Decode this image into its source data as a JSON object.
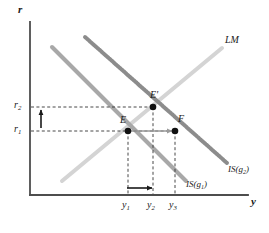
{
  "figure": {
    "kind": "is-lm-diagram",
    "background": "#ffffff"
  },
  "axes": {
    "y_axis_label": "r",
    "x_axis_label": "y",
    "axis_color": "#4d4d4d",
    "origin": [
      30,
      195
    ],
    "x_axis_end": [
      248,
      195
    ],
    "y_axis_end": [
      30,
      22
    ]
  },
  "ticks": {
    "y": [
      {
        "id": "r1",
        "base": "r",
        "sub": "1",
        "value_px": 131
      },
      {
        "id": "r2",
        "base": "r",
        "sub": "2",
        "value_px": 107
      }
    ],
    "x": [
      {
        "id": "y1",
        "base": "y",
        "sub": "1",
        "value_px": 128
      },
      {
        "id": "y2",
        "base": "y",
        "sub": "2",
        "value_px": 153
      },
      {
        "id": "y3",
        "base": "y",
        "sub": "3",
        "value_px": 175
      }
    ]
  },
  "curves": [
    {
      "id": "is-g1",
      "label_base": "IS(g",
      "label_sub": "1",
      "label_close": ")",
      "color": "#a8a8a8",
      "style": "solid",
      "width": 4,
      "from": [
        52,
        47
      ],
      "to": [
        186,
        181
      ]
    },
    {
      "id": "is-g2",
      "label_base": "IS(g",
      "label_sub": "2",
      "label_close": ")",
      "color": "#8c8c8c",
      "style": "beaded",
      "width": 4,
      "from": [
        85,
        37
      ],
      "to": [
        227,
        163
      ]
    },
    {
      "id": "lm",
      "label_base": "LM",
      "label_sub": "",
      "label_close": "",
      "color": "#d4d4d4",
      "style": "solid",
      "width": 4,
      "from": [
        62,
        181
      ],
      "to": [
        222,
        48
      ]
    }
  ],
  "points": [
    {
      "id": "E",
      "label": "E",
      "x": 128,
      "y": 131
    },
    {
      "id": "Ep",
      "label": "E'",
      "x": 153,
      "y": 107
    },
    {
      "id": "F",
      "label": "F",
      "x": 175,
      "y": 131
    }
  ],
  "guides": {
    "color": "#333333",
    "lines": [
      {
        "id": "r1-guide",
        "x1": 31,
        "y1": 131,
        "x2": 175,
        "y2": 131
      },
      {
        "id": "r2-guide",
        "x1": 31,
        "y1": 107,
        "x2": 153,
        "y2": 107
      },
      {
        "id": "y1-guide",
        "x1": 128,
        "y1": 131,
        "x2": 128,
        "y2": 194
      },
      {
        "id": "y2-guide",
        "x1": 153,
        "y1": 107,
        "x2": 153,
        "y2": 194
      },
      {
        "id": "y3-guide",
        "x1": 175,
        "y1": 131,
        "x2": 175,
        "y2": 194
      }
    ]
  },
  "arrows": [
    {
      "id": "rate-rise-arrow",
      "direction": "up",
      "color": "#1a1a1a",
      "x1": 41,
      "y1": 128,
      "x2": 41,
      "y2": 110
    },
    {
      "id": "output-rise-arrow",
      "direction": "right",
      "color": "#1a1a1a",
      "x1": 127,
      "y1": 188,
      "x2": 152,
      "y2": 188
    },
    {
      "id": "crowding-arrow",
      "direction": "right",
      "color": "#9a9a9a",
      "x1": 130,
      "y1": 131,
      "x2": 172,
      "y2": 131
    }
  ],
  "labels": {
    "lm": "LM",
    "is_g1_text": "IS(g₁)",
    "is_g2_text": "IS(g₂)",
    "point_e": "E",
    "point_e_prime": "E'",
    "point_f": "F"
  }
}
